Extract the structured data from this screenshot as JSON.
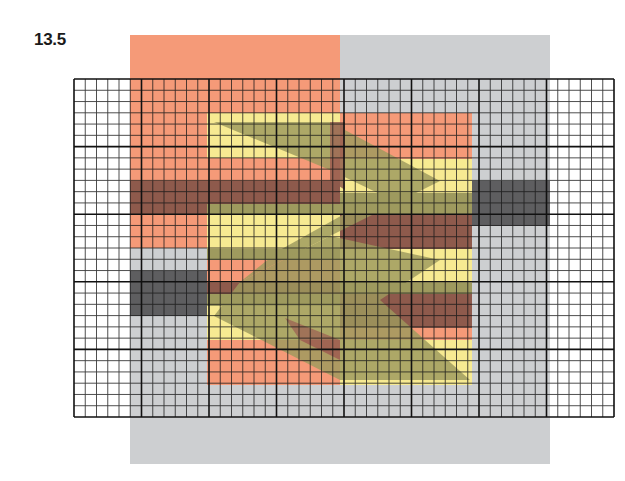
{
  "figure": {
    "label": "13.5",
    "grid": {
      "left": 74,
      "top": 79,
      "right": 614,
      "bottom": 417,
      "major_columns": 8,
      "major_rows": 5,
      "subdivisions": 6,
      "line_color": "#1a1a1a"
    },
    "colors": {
      "salmon": "#f59a78",
      "gray": "#cdcfd1",
      "yellow": "#f7ea92",
      "olive": "#9e9a5e",
      "brown": "#8e5a4c",
      "dark_gray": "#5e5e60"
    },
    "shapes": [
      {
        "name": "salmon-rect-top-left",
        "x": 130,
        "y": 35,
        "w": 210,
        "h": 213,
        "color": "salmon"
      },
      {
        "name": "gray-rect-right",
        "x": 340,
        "y": 35,
        "w": 210,
        "h": 429,
        "color": "gray"
      },
      {
        "name": "gray-rect-bottom-left",
        "x": 130,
        "y": 248,
        "w": 210,
        "h": 216,
        "color": "gray"
      },
      {
        "name": "salmon-rect-center-left",
        "x": 207,
        "y": 248,
        "w": 133,
        "h": 137,
        "color": "salmon"
      },
      {
        "name": "salmon-rect-center-right",
        "x": 340,
        "y": 113,
        "w": 132,
        "h": 272,
        "color": "salmon"
      }
    ]
  }
}
